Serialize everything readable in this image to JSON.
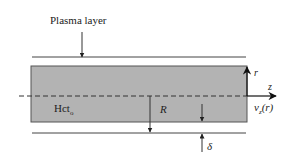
{
  "diagram": {
    "labels": {
      "plasma_layer": "Plasma layer",
      "hct": "Hct",
      "hct_sub": "o",
      "radius": "R",
      "r_axis": "r",
      "z_axis": "z",
      "velocity": "v",
      "velocity_sub": "z",
      "velocity_arg": "(r)",
      "delta": "δ"
    },
    "colors": {
      "core_fill": "#b3b3b3",
      "core_stroke": "#555555",
      "line": "#444444",
      "background": "#ffffff"
    }
  }
}
